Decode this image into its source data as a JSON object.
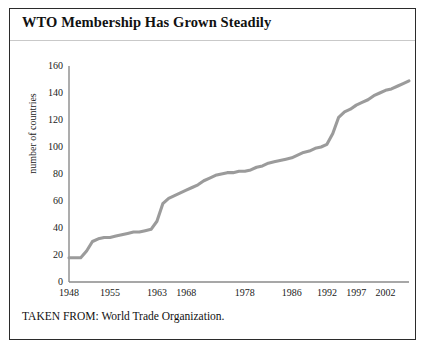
{
  "figure": {
    "title": "WTO Membership Has Grown Steadily",
    "source_note": "TAKEN FROM: World Trade Organization.",
    "border_color": "#2b2b2b",
    "background_color": "#ffffff"
  },
  "chart_data": {
    "type": "line",
    "title": "WTO Membership Has Grown Steadily",
    "subtitle": "",
    "xlabel": "",
    "ylabel": "number of countries",
    "xlim": [
      1948,
      2006
    ],
    "ylim": [
      0,
      160
    ],
    "grid": false,
    "legend": "none",
    "line_color": "#9b9b9b",
    "line_width": 3,
    "axis_color": "#8a8a8a",
    "x_tick_labels": [
      "1948",
      "1955",
      "1963",
      "1968",
      "1978",
      "1986",
      "1992",
      "1997",
      "2002"
    ],
    "x_tick_values": [
      1948,
      1955,
      1963,
      1968,
      1978,
      1986,
      1992,
      1997,
      2002
    ],
    "y_tick_labels": [
      "0",
      "20",
      "40",
      "60",
      "80",
      "100",
      "120",
      "140",
      "160"
    ],
    "y_tick_values": [
      0,
      20,
      40,
      60,
      80,
      100,
      120,
      140,
      160
    ],
    "series": [
      {
        "name": "number of countries",
        "x": [
          1948,
          1949,
          1950,
          1951,
          1952,
          1953,
          1954,
          1955,
          1956,
          1957,
          1958,
          1959,
          1960,
          1961,
          1962,
          1963,
          1964,
          1965,
          1966,
          1967,
          1968,
          1969,
          1970,
          1971,
          1972,
          1973,
          1974,
          1975,
          1976,
          1977,
          1978,
          1979,
          1980,
          1981,
          1982,
          1983,
          1984,
          1985,
          1986,
          1987,
          1988,
          1989,
          1990,
          1991,
          1992,
          1993,
          1994,
          1995,
          1996,
          1997,
          1998,
          1999,
          2000,
          2001,
          2002,
          2003,
          2004,
          2005,
          2006
        ],
        "y": [
          18,
          18,
          18,
          23,
          30,
          32,
          33,
          33,
          34,
          35,
          36,
          37,
          37,
          38,
          39,
          45,
          58,
          62,
          64,
          66,
          68,
          70,
          72,
          75,
          77,
          79,
          80,
          81,
          81,
          82,
          82,
          83,
          85,
          86,
          88,
          89,
          90,
          91,
          92,
          94,
          96,
          97,
          99,
          100,
          102,
          110,
          122,
          126,
          128,
          131,
          133,
          135,
          138,
          140,
          142,
          143,
          145,
          147,
          149
        ]
      }
    ],
    "annotations": [
      {
        "text": "Sharp rise around 1963 (decolonization)",
        "x": 1963,
        "y": 58
      },
      {
        "text": "WTO founded 1995, membership jumps past 120",
        "x": 1995,
        "y": 126
      }
    ]
  }
}
